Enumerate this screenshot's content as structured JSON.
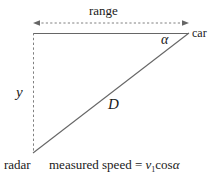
{
  "figure": {
    "title_label": "range",
    "labels": {
      "range": "range",
      "car": "car",
      "alpha": "α",
      "y": "y",
      "hypotenuse": "D",
      "radar": "radar"
    },
    "formula": {
      "text": "measured speed = v₁cosα",
      "lead": "measured speed",
      "equals": " = ",
      "variable": "v",
      "subscript": "1",
      "function": "cos",
      "angle": "α"
    },
    "colors": {
      "line": "#666666",
      "dashed": "#808080",
      "text": "#1a1a1a",
      "background": "#ffffff"
    },
    "geometry": {
      "radar_vertex": [
        33,
        153
      ],
      "corner_vertex": [
        33,
        33
      ],
      "car_vertex": [
        189,
        33
      ],
      "range_arrow_y": 23,
      "range_arrow_x_start": 33,
      "range_arrow_x_end": 189
    }
  }
}
